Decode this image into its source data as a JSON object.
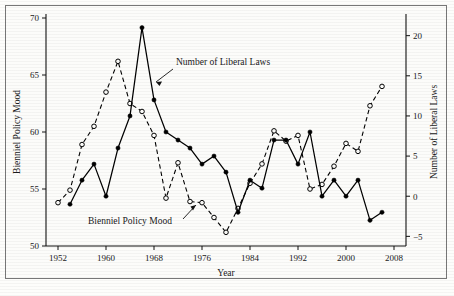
{
  "figure": {
    "background_color": "#fdfdfb",
    "frame_color": "#777777",
    "ink_color": "#000000"
  },
  "annotations": {
    "laws_label": "Number of Liberal Laws",
    "mood_label": "Bienniel Policy Mood"
  },
  "chart_data": {
    "type": "line",
    "title": "",
    "xlabel": "Year",
    "ylabel": "Bienniel Policy Mood",
    "y2label": "Number of Liberal Laws",
    "xlim": [
      1950,
      2010
    ],
    "ylim": [
      50,
      70
    ],
    "y2lim": [
      -6.2,
      22.2
    ],
    "xticks": [
      1952,
      1960,
      1968,
      1976,
      1984,
      1992,
      2000,
      2008
    ],
    "xticklabels": [
      "1952",
      "1960",
      "1968",
      "1976",
      "1984",
      "1992",
      "2000",
      "2008"
    ],
    "yticks": [
      50,
      55,
      60,
      65,
      70
    ],
    "yticklabels": [
      "50",
      "55",
      "60",
      "65",
      "70"
    ],
    "y2ticks": [
      -5,
      0,
      5,
      10,
      15,
      20
    ],
    "y2ticklabels": [
      "−5",
      "0",
      "5",
      "10",
      "15",
      "20"
    ],
    "grid": false,
    "legend": "none (inline annotations)",
    "series": [
      {
        "name": "Bienniel Policy Mood",
        "axis": "left",
        "style": "dashed",
        "marker": "open-circle",
        "x": [
          1952,
          1954,
          1956,
          1958,
          1960,
          1962,
          1964,
          1966,
          1968,
          1970,
          1972,
          1974,
          1976,
          1978,
          1980,
          1982,
          1984,
          1986,
          1988,
          1990,
          1992,
          1994,
          1996,
          1998,
          2000,
          2002,
          2004,
          2006
        ],
        "values": [
          53.8,
          54.9,
          58.9,
          60.5,
          63.5,
          66.2,
          62.5,
          61.8,
          59.7,
          54.2,
          57.3,
          53.9,
          53.8,
          52.5,
          51.2,
          53.3,
          55.5,
          57.2,
          60.1,
          59.2,
          59.7,
          55.0,
          55.4,
          57.0,
          59.0,
          58.3,
          62.3,
          64.0
        ]
      },
      {
        "name": "Number of Liberal Laws",
        "axis": "right",
        "style": "solid",
        "marker": "filled-circle",
        "x": [
          1954,
          1956,
          1958,
          1960,
          1962,
          1964,
          1966,
          1968,
          1970,
          1972,
          1974,
          1976,
          1978,
          1980,
          1982,
          1984,
          1986,
          1988,
          1990,
          1992,
          1994,
          1996,
          1998,
          2000,
          2002,
          2004,
          2006
        ],
        "values": [
          -1.0,
          2.0,
          4.0,
          0.0,
          6.0,
          10.0,
          21.0,
          12.0,
          8.0,
          7.0,
          6.0,
          4.0,
          5.0,
          3.0,
          -2.0,
          2.0,
          1.0,
          7.0,
          7.0,
          4.0,
          8.0,
          0.0,
          2.0,
          0.0,
          2.0,
          -3.0,
          -2.0
        ]
      }
    ]
  }
}
